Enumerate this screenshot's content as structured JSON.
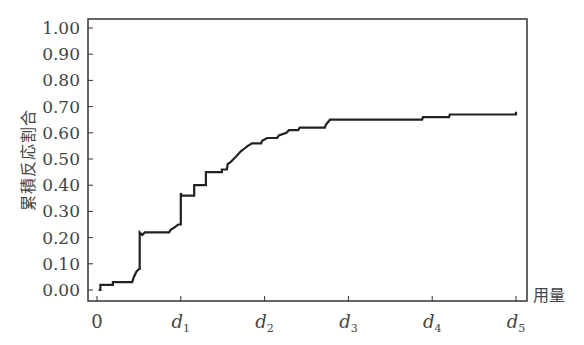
{
  "chart_data": {
    "type": "line",
    "subtype": "step",
    "title": "",
    "xlabel": "用量",
    "ylabel": "累積反応割合",
    "ylim": [
      0.0,
      1.0
    ],
    "grid": false,
    "legend": null,
    "y_ticks": [
      "0.00",
      "0.10",
      "0.20",
      "0.30",
      "0.40",
      "0.50",
      "0.60",
      "0.70",
      "0.80",
      "0.90",
      "1.00"
    ],
    "x_ticks": [
      {
        "base": "0",
        "sub": ""
      },
      {
        "base": "d",
        "sub": "1"
      },
      {
        "base": "d",
        "sub": "2"
      },
      {
        "base": "d",
        "sub": "3"
      },
      {
        "base": "d",
        "sub": "4"
      },
      {
        "base": "d",
        "sub": "5"
      }
    ],
    "x_units_note": "x in units where 0=0 and d1..d5 = 1..5",
    "series": [
      {
        "name": "cumulative response",
        "color": "#222222",
        "points": [
          [
            0.02,
            0.0
          ],
          [
            0.04,
            0.0
          ],
          [
            0.04,
            0.02
          ],
          [
            0.19,
            0.02
          ],
          [
            0.19,
            0.03
          ],
          [
            0.42,
            0.03
          ],
          [
            0.44,
            0.05
          ],
          [
            0.47,
            0.07
          ],
          [
            0.5,
            0.08
          ],
          [
            0.51,
            0.08
          ],
          [
            0.51,
            0.22
          ],
          [
            0.54,
            0.21
          ],
          [
            0.57,
            0.22
          ],
          [
            0.86,
            0.22
          ],
          [
            0.88,
            0.23
          ],
          [
            0.93,
            0.24
          ],
          [
            0.97,
            0.25
          ],
          [
            1.0,
            0.25
          ],
          [
            1.0,
            0.37
          ],
          [
            1.01,
            0.36
          ],
          [
            1.16,
            0.36
          ],
          [
            1.16,
            0.4
          ],
          [
            1.3,
            0.4
          ],
          [
            1.3,
            0.45
          ],
          [
            1.49,
            0.45
          ],
          [
            1.49,
            0.46
          ],
          [
            1.55,
            0.46
          ],
          [
            1.56,
            0.48
          ],
          [
            1.6,
            0.49
          ],
          [
            1.63,
            0.5
          ],
          [
            1.66,
            0.51
          ],
          [
            1.69,
            0.52
          ],
          [
            1.72,
            0.53
          ],
          [
            1.76,
            0.54
          ],
          [
            1.8,
            0.55
          ],
          [
            1.85,
            0.56
          ],
          [
            1.96,
            0.56
          ],
          [
            1.97,
            0.57
          ],
          [
            2.03,
            0.58
          ],
          [
            2.15,
            0.58
          ],
          [
            2.17,
            0.59
          ],
          [
            2.26,
            0.6
          ],
          [
            2.29,
            0.61
          ],
          [
            2.4,
            0.61
          ],
          [
            2.42,
            0.62
          ],
          [
            2.72,
            0.62
          ],
          [
            2.73,
            0.63
          ],
          [
            2.78,
            0.65
          ],
          [
            3.88,
            0.65
          ],
          [
            3.89,
            0.66
          ],
          [
            4.2,
            0.66
          ],
          [
            4.21,
            0.67
          ],
          [
            5.0,
            0.67
          ],
          [
            5.0,
            0.68
          ]
        ]
      }
    ]
  }
}
